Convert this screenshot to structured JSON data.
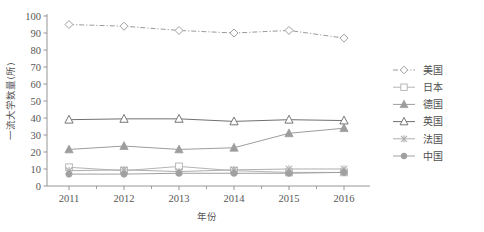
{
  "chart_data": {
    "type": "line",
    "title": "",
    "xlabel": "年份",
    "ylabel": "一流大学数量(所)",
    "categories": [
      "2011",
      "2012",
      "2013",
      "2014",
      "2015",
      "2016"
    ],
    "x": [
      2011,
      2012,
      2013,
      2014,
      2015,
      2016
    ],
    "xlim": [
      2010.6,
      2016.4
    ],
    "ylim": [
      0,
      100
    ],
    "yticks": [
      0,
      10,
      20,
      30,
      40,
      50,
      60,
      70,
      80,
      90,
      100
    ],
    "ytick_labels": [
      "0",
      "10",
      "20",
      "30",
      "40",
      "50",
      "60",
      "70",
      "80",
      "90",
      "100"
    ],
    "grid": false,
    "legend_position": "right",
    "minor_xticks": true,
    "series": [
      {
        "name": "美国",
        "marker": "open-diamond",
        "linestyle": "dash-dot",
        "color": "#9a9a9a",
        "values": [
          95,
          94,
          91.5,
          90,
          91.5,
          87
        ]
      },
      {
        "name": "日本",
        "marker": "open-square",
        "linestyle": "solid",
        "color": "#b4b4b4",
        "values": [
          11,
          9,
          11.5,
          9,
          8,
          8
        ]
      },
      {
        "name": "德国",
        "marker": "filled-triangle",
        "linestyle": "solid",
        "color": "#9d9d9d",
        "values": [
          21.5,
          23.5,
          21.5,
          22.5,
          31,
          34
        ]
      },
      {
        "name": "英国",
        "marker": "open-triangle",
        "linestyle": "solid",
        "color": "#707070",
        "values": [
          39,
          39.5,
          39.5,
          38,
          39,
          38.5
        ]
      },
      {
        "name": "法国",
        "marker": "x-cross",
        "linestyle": "solid",
        "color": "#adadad",
        "values": [
          9,
          9.5,
          8.5,
          9.5,
          10,
          10
        ]
      },
      {
        "name": "中国",
        "marker": "filled-circle",
        "linestyle": "solid",
        "color": "#a0a0a0",
        "values": [
          7,
          7,
          7.5,
          7.5,
          7.5,
          8
        ]
      }
    ]
  },
  "axes": {
    "y_title": "一流大学数量(所)",
    "x_title": "年份"
  },
  "legend": {
    "entries": [
      {
        "label": "美国"
      },
      {
        "label": "日本"
      },
      {
        "label": "德国"
      },
      {
        "label": "英国"
      },
      {
        "label": "法国"
      },
      {
        "label": "中国"
      }
    ]
  },
  "colors": {
    "axis": "#8a8a8a",
    "text": "#4d4d4d",
    "background": "#ffffff"
  }
}
